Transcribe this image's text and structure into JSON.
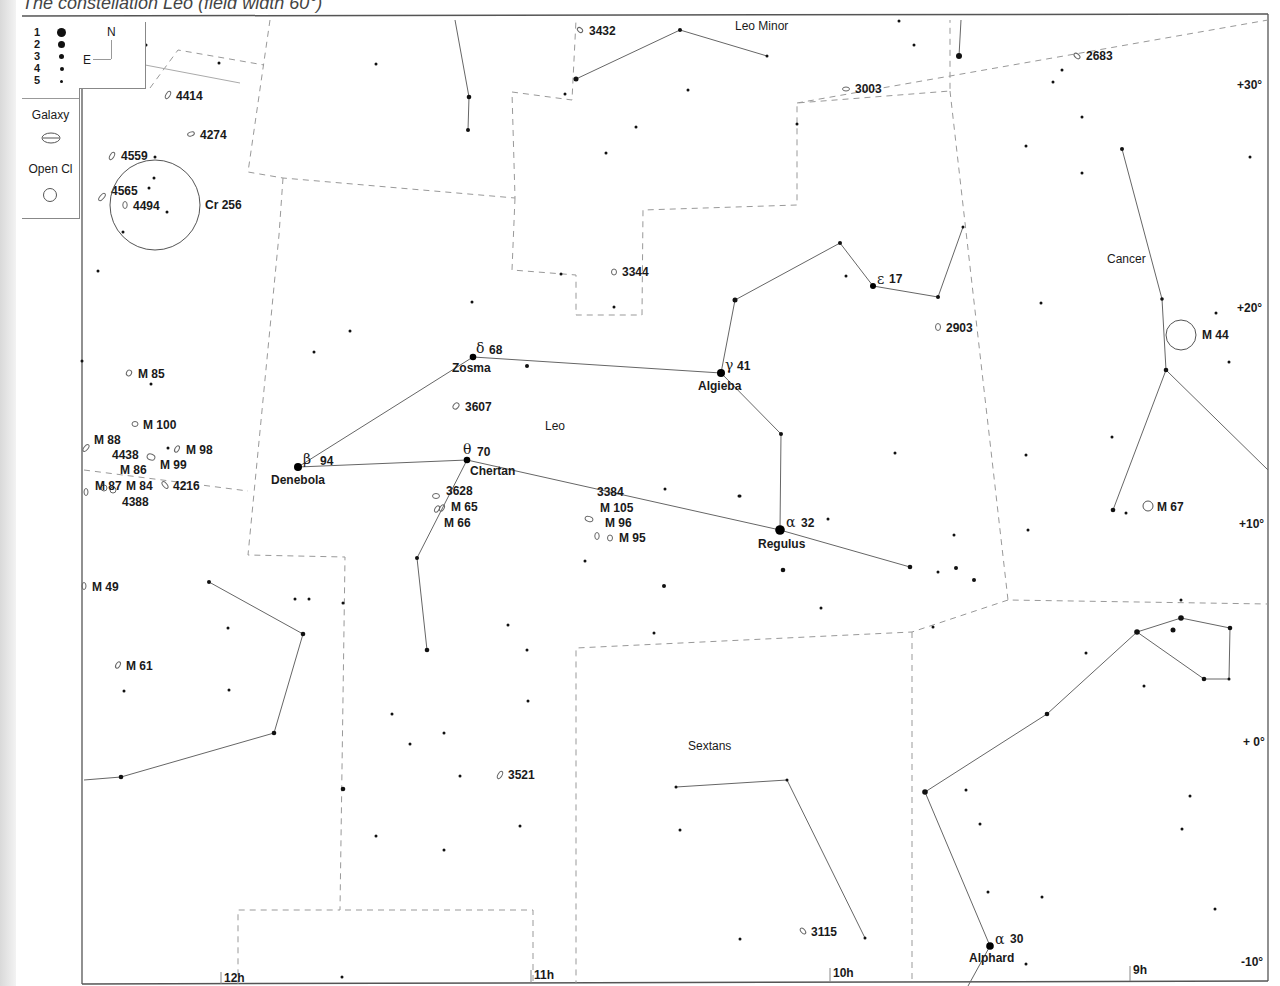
{
  "caption": "The constellation Leo (field width 60°)",
  "credit": "Megastar",
  "legend": {
    "magnitudes": [
      {
        "label": "1",
        "size": 9
      },
      {
        "label": "2",
        "size": 7
      },
      {
        "label": "3",
        "size": 5
      },
      {
        "label": "4",
        "size": 4
      },
      {
        "label": "5",
        "size": 3
      }
    ],
    "galaxy_label": "Galaxy",
    "open_cluster_label": "Open Cl"
  },
  "compass": {
    "north": "N",
    "east": "E"
  },
  "axes": {
    "ra_labels": [
      {
        "label": "12h",
        "x": 222
      },
      {
        "label": "11h",
        "x": 533
      },
      {
        "label": "10h",
        "x": 832
      },
      {
        "label": "9h",
        "x": 1132
      }
    ],
    "dec_labels": [
      {
        "label": "+30°",
        "y": 85
      },
      {
        "label": "+20°",
        "y": 308
      },
      {
        "label": "+10°",
        "y": 524
      },
      {
        "label": "+ 0°",
        "y": 742
      },
      {
        "label": "-10°",
        "y": 962
      }
    ]
  },
  "constellations": [
    {
      "name": "Leo",
      "x": 545,
      "y": 430
    },
    {
      "name": "Leo Minor",
      "x": 735,
      "y": 30
    },
    {
      "name": "Cancer",
      "x": 1107,
      "y": 263
    },
    {
      "name": "Sextans",
      "x": 688,
      "y": 750
    }
  ],
  "named_stars": [
    {
      "greek": "δ",
      "number": "68",
      "name": "Zosma",
      "x": 473,
      "y": 357
    },
    {
      "greek": "γ",
      "number": "41",
      "name": "Algieba",
      "x": 721,
      "y": 373
    },
    {
      "greek": "ε",
      "number": "17",
      "name": "",
      "x": 873,
      "y": 286
    },
    {
      "greek": "β",
      "number": "94",
      "name": "Denebola",
      "x": 298,
      "y": 467
    },
    {
      "greek": "θ",
      "number": "70",
      "name": "Chertan",
      "x": 467,
      "y": 460
    },
    {
      "greek": "α",
      "number": "32",
      "name": "Regulus",
      "x": 780,
      "y": 530
    },
    {
      "greek": "α",
      "number": "30",
      "name": "Alphard",
      "x": 990,
      "y": 946
    }
  ],
  "deep_sky": [
    {
      "type": "galaxy",
      "label": "3432",
      "x": 580,
      "y": 30
    },
    {
      "type": "galaxy",
      "label": "3003",
      "x": 846,
      "y": 89
    },
    {
      "type": "galaxy",
      "label": "2683",
      "x": 1077,
      "y": 56
    },
    {
      "type": "galaxy",
      "label": "4414",
      "x": 168,
      "y": 95
    },
    {
      "type": "galaxy",
      "label": "4274",
      "x": 191,
      "y": 134
    },
    {
      "type": "galaxy",
      "label": "4559",
      "x": 112,
      "y": 156
    },
    {
      "type": "galaxy",
      "label": "4565",
      "x": 102,
      "y": 197
    },
    {
      "type": "galaxy",
      "label": "4494",
      "x": 125,
      "y": 205
    },
    {
      "type": "galaxy",
      "label": "3344",
      "x": 614,
      "y": 272
    },
    {
      "type": "galaxy",
      "label": "2903",
      "x": 938,
      "y": 327
    },
    {
      "type": "galaxy",
      "label": "M 85",
      "x": 129,
      "y": 373
    },
    {
      "type": "galaxy",
      "label": "M 100",
      "x": 135,
      "y": 424
    },
    {
      "type": "galaxy",
      "label": "M 88",
      "x": 86,
      "y": 448
    },
    {
      "type": "galaxy",
      "label": "4438",
      "x": 151,
      "y": 457
    },
    {
      "type": "galaxy",
      "label": "M 98",
      "x": 177,
      "y": 449
    },
    {
      "type": "galaxy",
      "label": "M 99",
      "x": 151,
      "y": 457
    },
    {
      "type": "galaxy",
      "label": "M 86",
      "x": 125,
      "y": 482
    },
    {
      "type": "galaxy",
      "label": "M 87",
      "x": 86,
      "y": 492
    },
    {
      "type": "galaxy",
      "label": "M 84",
      "x": 112,
      "y": 487
    },
    {
      "type": "galaxy",
      "label": "4216",
      "x": 165,
      "y": 485
    },
    {
      "type": "galaxy",
      "label": "4388",
      "x": 122,
      "y": 501
    },
    {
      "type": "galaxy",
      "label": "3607",
      "x": 456,
      "y": 406
    },
    {
      "type": "galaxy",
      "label": "3628",
      "x": 436,
      "y": 496
    },
    {
      "type": "galaxy",
      "label": "M 65",
      "x": 438,
      "y": 508
    },
    {
      "type": "galaxy",
      "label": "M 66",
      "x": 442,
      "y": 508
    },
    {
      "type": "galaxy",
      "label": "3384",
      "x": 0,
      "y": 0
    },
    {
      "type": "galaxy",
      "label": "M 105",
      "x": 0,
      "y": 0
    },
    {
      "type": "galaxy",
      "label": "M 96",
      "x": 589,
      "y": 519
    },
    {
      "type": "galaxy",
      "label": "M 95",
      "x": 610,
      "y": 538
    },
    {
      "type": "galaxy",
      "label": "M 49",
      "x": 84,
      "y": 586
    },
    {
      "type": "galaxy",
      "label": "M 61",
      "x": 118,
      "y": 665
    },
    {
      "type": "galaxy",
      "label": "3521",
      "x": 500,
      "y": 775
    },
    {
      "type": "galaxy",
      "label": "3115",
      "x": 803,
      "y": 931
    },
    {
      "type": "open_cluster",
      "label": "Cr 256",
      "x": 155,
      "y": 205
    },
    {
      "type": "open_cluster",
      "label": "M 44",
      "x": 1181,
      "y": 335
    },
    {
      "type": "open_cluster",
      "label": "M 67",
      "x": 1148,
      "y": 506
    }
  ]
}
